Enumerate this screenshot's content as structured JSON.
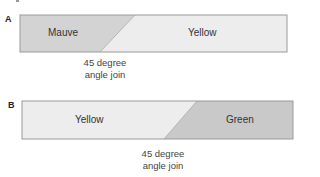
{
  "diagrams": [
    {
      "label": "A",
      "left_segment": {
        "name": "Mauve",
        "fill": "#d3d3d3"
      },
      "right_segment": {
        "name": "Yellow",
        "fill": "#ededed"
      },
      "annotation": {
        "line1": "45 degree",
        "line2": "angle join"
      }
    },
    {
      "label": "B",
      "left_segment": {
        "name": "Yellow",
        "fill": "#ededed"
      },
      "right_segment": {
        "name": "Green",
        "fill": "#c9c9c9"
      },
      "annotation": {
        "line1": "45 degree",
        "line2": "angle join"
      }
    }
  ],
  "colors": {
    "border": "#9a9a9a"
  }
}
